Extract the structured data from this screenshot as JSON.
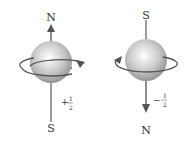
{
  "diagram": {
    "left_spin": {
      "top_label": "N",
      "bottom_label": "S",
      "sign": "+",
      "num": "1",
      "den": "2",
      "arrow_direction": "up",
      "rotation": "counterclockwise-front-right"
    },
    "right_spin": {
      "top_label": "S",
      "bottom_label": "N",
      "sign": "−",
      "num": "1",
      "den": "2",
      "arrow_direction": "down",
      "rotation": "opposite"
    },
    "colors": {
      "sphere_light": "#ffffff",
      "sphere_dark": "#8a8a8a",
      "line": "#555555"
    }
  }
}
